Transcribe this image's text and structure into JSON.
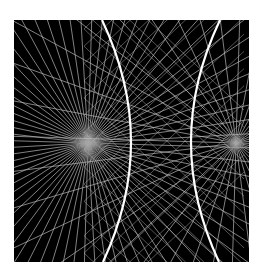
{
  "figure": {
    "background_color": "#000000",
    "page_color": "#ffffff",
    "ray_color": "#bfbfbf",
    "curve_color": "#ffffff",
    "bounds": {
      "x": 14,
      "y": 20,
      "width": 235,
      "height": 242
    },
    "foci": [
      {
        "name": "left-focus",
        "x": 74,
        "y": 123,
        "ray_count": 72
      },
      {
        "name": "right-focus",
        "x": 222,
        "y": 123,
        "ray_count": 40
      }
    ],
    "curves": [
      {
        "name": "left-curve",
        "top_x": 88,
        "mid_x": 117,
        "bottom_x": 89
      },
      {
        "name": "right-curve",
        "top_x": 206,
        "mid_x": 177,
        "bottom_x": 205
      }
    ],
    "cross_lines": 22
  }
}
